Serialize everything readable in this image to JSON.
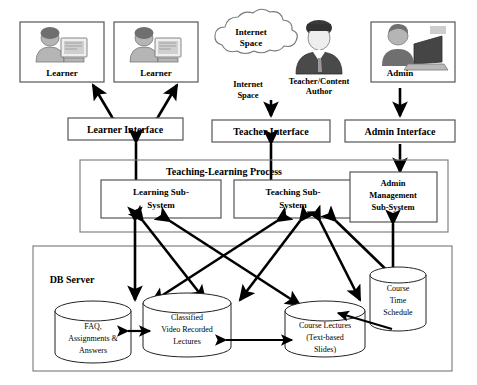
{
  "diagram": {
    "actors": [
      {
        "id": "learner1",
        "label": "Learner",
        "icon": "person-at-computer-icon"
      },
      {
        "id": "learner2",
        "label": "Learner",
        "icon": "person-at-computer-icon"
      },
      {
        "id": "teacher",
        "label_line1": "Teacher/Content",
        "label_line2": "Author",
        "icon": "businessman-icon"
      },
      {
        "id": "admin",
        "label": "Admin",
        "icon": "person-at-laptop-icon"
      }
    ],
    "cloud": {
      "line1": "Internet",
      "line2": "Space"
    },
    "cloud_caption": {
      "line1": "Internet",
      "line2": "Space"
    },
    "interfaces": [
      {
        "id": "learner-interface",
        "label": "Learner Interface"
      },
      {
        "id": "teacher-interface",
        "label": "Teacher Interface"
      },
      {
        "id": "admin-interface",
        "label": "Admin Interface"
      }
    ],
    "process": {
      "title": "Teaching-Learning Process",
      "subsystems": [
        {
          "id": "learning-sub-system",
          "line1": "Learning Sub-",
          "line2": "System"
        },
        {
          "id": "teaching-sub-system",
          "line1": "Teaching Sub-",
          "line2": "System"
        },
        {
          "id": "admin-management-sub-system",
          "line1": "Admin",
          "line2": "Management",
          "line3": "Sub-System"
        }
      ]
    },
    "db_server": {
      "label": "DB Server",
      "stores": [
        {
          "id": "faq-store",
          "line1": "FAQ,",
          "line2": "Assignments &",
          "line3": "Answers"
        },
        {
          "id": "video-lectures-store",
          "line1": "Classified",
          "line2": "Video Recorded",
          "line3": "Lectures"
        },
        {
          "id": "course-lectures-store",
          "line1": "Course Lectures",
          "line2": "(Text-based",
          "line3": "Slides)"
        },
        {
          "id": "course-time-schedule-store",
          "line1": "Course",
          "line2": "Time",
          "line3": "Schedule"
        }
      ]
    },
    "colors": {
      "line": "#000000",
      "box_stroke": "#555555",
      "background": "#ffffff"
    }
  }
}
